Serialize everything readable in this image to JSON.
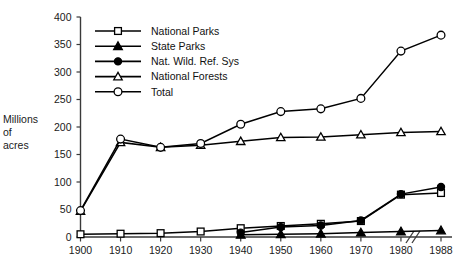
{
  "chart_data": {
    "type": "line",
    "title": "",
    "subtitle": "",
    "xlabel": "",
    "ylabel": "Millions of acres",
    "ylabel_lines": [
      "Millions",
      "of",
      "acres"
    ],
    "grid": false,
    "legend_position": "top-center",
    "axis_break": {
      "present": true,
      "between": [
        "1980",
        "1988"
      ],
      "symbol": "//"
    },
    "x": [
      1900,
      1910,
      1920,
      1930,
      1940,
      1950,
      1960,
      1970,
      1980,
      1988
    ],
    "categories": [
      "1900",
      "1910",
      "1920",
      "1930",
      "1940",
      "1950",
      "1960",
      "1970",
      "1980",
      "1988"
    ],
    "xtick_labels": [
      "1900",
      "1910",
      "1920",
      "1930",
      "1940",
      "1950",
      "1960",
      "1970",
      "1980",
      "1988"
    ],
    "ytick_labels": [
      "0",
      "50",
      "100",
      "150",
      "200",
      "250",
      "300",
      "350",
      "400"
    ],
    "yticks": [
      0,
      50,
      100,
      150,
      200,
      250,
      300,
      350,
      400
    ],
    "ylim": [
      0,
      400
    ],
    "series": [
      {
        "name": "National Parks",
        "marker": "open-square",
        "values": [
          5,
          6,
          7,
          10,
          16,
          20,
          24,
          29,
          77,
          80
        ]
      },
      {
        "name": "State Parks",
        "marker": "filled-triangle",
        "values": [
          null,
          null,
          null,
          null,
          4,
          5,
          6,
          8,
          10,
          12
        ]
      },
      {
        "name": "Nat. Wild. Ref. Sys",
        "marker": "filled-circle",
        "values": [
          null,
          null,
          null,
          null,
          8,
          18,
          21,
          30,
          78,
          91
        ]
      },
      {
        "name": "National Forests",
        "marker": "open-triangle",
        "values": [
          47,
          172,
          163,
          167,
          174,
          181,
          182,
          186,
          190,
          192
        ]
      },
      {
        "name": "Total",
        "marker": "open-circle",
        "values": [
          48,
          178,
          163,
          170,
          205,
          228,
          233,
          252,
          338,
          367
        ]
      }
    ]
  },
  "legend": {
    "items": [
      {
        "label": "National Parks",
        "marker": "open-square"
      },
      {
        "label": "State Parks",
        "marker": "filled-triangle"
      },
      {
        "label": "Nat. Wild. Ref. Sys",
        "marker": "filled-circle"
      },
      {
        "label": "National Forests",
        "marker": "open-triangle"
      },
      {
        "label": "Total",
        "marker": "open-circle"
      }
    ]
  },
  "colors": {
    "ink": "#000000",
    "axis": "#3a3a3a",
    "background": "#ffffff",
    "marker_fill_open": "#ffffff"
  }
}
